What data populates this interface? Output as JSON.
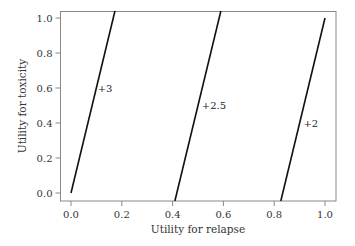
{
  "chart_data": {
    "type": "line",
    "title": "",
    "xlabel": "Utility for relapse",
    "ylabel": "Utility for toxicity",
    "xlim": [
      -0.04,
      1.04
    ],
    "ylim": [
      -0.046,
      1.04
    ],
    "xticks": [
      0.0,
      0.2,
      0.4,
      0.6,
      0.8,
      1.0
    ],
    "xtick_labels": [
      "0.0",
      "0.2",
      "0.4",
      "0.6",
      "0.8",
      "1.0"
    ],
    "yticks": [
      0.0,
      0.2,
      0.4,
      0.6,
      0.8,
      1.0
    ],
    "ytick_labels": [
      "0.0",
      "0.2",
      "0.4",
      "0.6",
      "0.8",
      "1.0"
    ],
    "grid": false,
    "legend": "none",
    "series": [
      {
        "name": "+3",
        "label": "+3",
        "points": [
          [
            0.0,
            0.0
          ],
          [
            0.173,
            1.04
          ]
        ],
        "label_at": [
          0.105,
          0.6
        ]
      },
      {
        "name": "+2.5",
        "label": "+2.5",
        "points": [
          [
            0.409,
            -0.046
          ],
          [
            0.59,
            1.04
          ]
        ],
        "label_at": [
          0.515,
          0.5
        ]
      },
      {
        "name": "+2",
        "label": "+2",
        "points": [
          [
            0.826,
            -0.046
          ],
          [
            1.0,
            1.0
          ]
        ],
        "label_at": [
          0.915,
          0.4
        ]
      }
    ],
    "line_color": "#111111"
  }
}
